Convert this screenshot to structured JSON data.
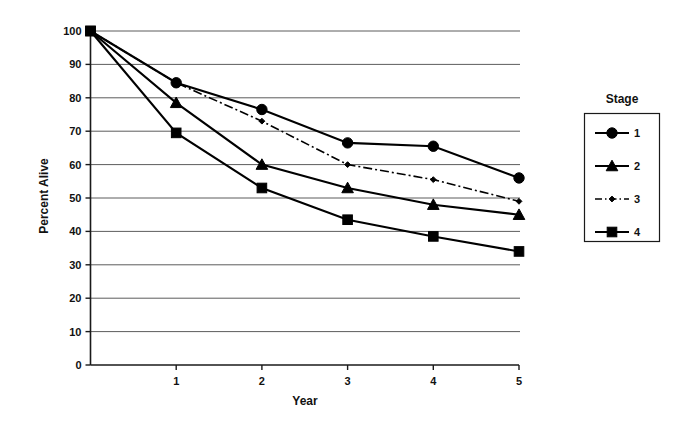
{
  "chart_data": {
    "type": "line",
    "title": "",
    "xlabel": "Year",
    "ylabel": "Percent Alive",
    "x": [
      0,
      1,
      2,
      3,
      4,
      5
    ],
    "xlim": [
      0,
      5
    ],
    "ylim": [
      0,
      100
    ],
    "xticks": [
      "1",
      "2",
      "3",
      "4",
      "5"
    ],
    "xtick_values": [
      1,
      2,
      3,
      4,
      5
    ],
    "yticks": [
      "0",
      "10",
      "20",
      "30",
      "40",
      "50",
      "60",
      "70",
      "80",
      "90",
      "100"
    ],
    "ytick_values": [
      0,
      10,
      20,
      30,
      40,
      50,
      60,
      70,
      80,
      90,
      100
    ],
    "grid": true,
    "grid_axis": "y",
    "legend_position": "right",
    "legend_title": "Stage",
    "series": [
      {
        "name": "1",
        "marker": "circle",
        "linestyle": "solid",
        "values": [
          100,
          84.5,
          76.5,
          66.5,
          65.5,
          56
        ]
      },
      {
        "name": "2",
        "marker": "triangle",
        "linestyle": "solid",
        "values": [
          100,
          78.5,
          60,
          53,
          48,
          45
        ]
      },
      {
        "name": "3",
        "marker": "diamond-small",
        "linestyle": "dashdot",
        "values": [
          100,
          84.5,
          73,
          60,
          55.5,
          49
        ]
      },
      {
        "name": "4",
        "marker": "square",
        "linestyle": "solid",
        "values": [
          100,
          69.5,
          53,
          43.5,
          38.5,
          34
        ]
      }
    ]
  },
  "legend": {
    "title": "Stage",
    "entries": [
      {
        "label": "1",
        "marker": "circle-icon",
        "linestyle": "solid"
      },
      {
        "label": "2",
        "marker": "triangle-icon",
        "linestyle": "solid"
      },
      {
        "label": "3",
        "marker": "diamond-icon",
        "linestyle": "dashdot"
      },
      {
        "label": "4",
        "marker": "square-icon",
        "linestyle": "solid"
      }
    ]
  },
  "axes": {
    "x_title": "Year",
    "y_title": "Percent Alive"
  }
}
